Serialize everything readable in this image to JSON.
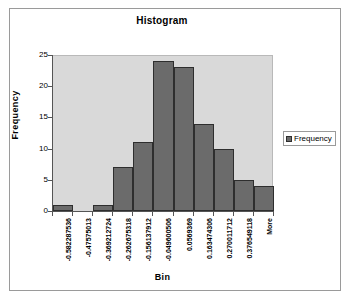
{
  "chart_data": {
    "type": "bar",
    "title": "Histogram",
    "xlabel": "Bin",
    "ylabel": "Frequency",
    "categories": [
      "-0.582287536",
      "-0.47575013",
      "-0.369212724",
      "-0.262675318",
      "-0.156137912",
      "-0.049600506",
      "0.0569369",
      "0.163474306",
      "0.270011712",
      "0.376549118",
      "More"
    ],
    "values": [
      1,
      0,
      1,
      7,
      11,
      24,
      23,
      14,
      10,
      5,
      4
    ],
    "ylim": [
      0,
      25
    ],
    "yticks": [
      0,
      5,
      10,
      15,
      20,
      25
    ],
    "ytick_labels": [
      "0",
      "5",
      "10",
      "15",
      "20",
      "25"
    ],
    "grid": false,
    "legend": {
      "position": "right",
      "entries": [
        {
          "name": "Frequency",
          "color": "#6b6b6b"
        }
      ]
    },
    "series": [
      {
        "name": "Frequency",
        "values": [
          1,
          0,
          1,
          7,
          11,
          24,
          23,
          14,
          10,
          5,
          4
        ]
      }
    ],
    "colors": {
      "bar_fill": "#6b6b6b",
      "bar_border": "#2e2e2e",
      "plot_background": "#d9d9d9",
      "chart_background": "#ffffff",
      "axis_line": "#555555",
      "frame_border": "#9a9a9a",
      "text": "#000000"
    }
  }
}
